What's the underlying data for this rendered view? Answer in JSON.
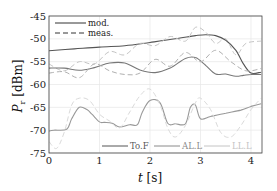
{
  "chart_data": {
    "type": "line",
    "title": "",
    "xlabel": "t [s]",
    "ylabel": "P_r [dBm]",
    "xlim": [
      0,
      4.2
    ],
    "ylim": [
      -75,
      -45
    ],
    "xticks": [
      0,
      1,
      2,
      3,
      4
    ],
    "yticks": [
      -45,
      -50,
      -55,
      -60,
      -65,
      -70,
      -75
    ],
    "grid": true,
    "legends": [
      {
        "position": "upper-left",
        "entries": [
          {
            "label": "mod.",
            "style": "solid"
          },
          {
            "label": "meas.",
            "style": "dashed"
          }
        ]
      },
      {
        "position": "lower-right",
        "entries": [
          {
            "label": "To.F",
            "color": "#555555"
          },
          {
            "label": "AL.L",
            "color": "#8a8a8a"
          },
          {
            "label": "LL.L",
            "color": "#c4c4c4"
          }
        ]
      }
    ],
    "series": [
      {
        "name": "To.F mod.",
        "color": "#555555",
        "style": "solid",
        "x": [
          0,
          0.5,
          1.0,
          1.5,
          2.0,
          2.5,
          2.9,
          3.1,
          3.3,
          3.5,
          3.7,
          3.85,
          4.0,
          4.2
        ],
        "y": [
          -52.6,
          -52.2,
          -51.8,
          -51.5,
          -50.8,
          -50.0,
          -49.3,
          -49.1,
          -49.3,
          -50.3,
          -52.5,
          -55.5,
          -57.5,
          -57.3
        ]
      },
      {
        "name": "To.F meas.",
        "color": "#c4c4c4",
        "style": "dashed",
        "x": [
          0,
          0.3,
          0.6,
          0.9,
          1.2,
          1.5,
          1.8,
          2.1,
          2.4,
          2.7,
          2.9,
          3.1,
          3.3,
          3.5,
          3.7,
          3.9,
          4.2
        ],
        "y": [
          -55.5,
          -57.0,
          -55.0,
          -55.5,
          -52.8,
          -53.5,
          -51.0,
          -51.5,
          -49.5,
          -50.5,
          -47.5,
          -48.5,
          -51.0,
          -50.0,
          -53.5,
          -51.0,
          -50.5
        ]
      },
      {
        "name": "AL.L mod.",
        "color": "#777777",
        "style": "solid",
        "x": [
          0,
          0.3,
          0.6,
          0.9,
          1.2,
          1.5,
          1.8,
          2.1,
          2.4,
          2.7,
          2.9,
          3.1,
          3.3,
          3.5,
          3.7,
          3.85,
          4.0,
          4.2
        ],
        "y": [
          -56.4,
          -56.4,
          -56.9,
          -56.3,
          -55.3,
          -55.3,
          -56.8,
          -57.4,
          -56.4,
          -54.3,
          -54.1,
          -55.8,
          -57.7,
          -57.7,
          -58.2,
          -58.0,
          -57.8,
          -57.8
        ]
      },
      {
        "name": "AL.L meas.",
        "color": "#b0b0b0",
        "style": "dashed",
        "x": [
          0,
          0.3,
          0.6,
          0.9,
          1.2,
          1.5,
          1.8,
          2.1,
          2.4,
          2.7,
          3.0,
          3.3,
          3.6,
          3.9,
          4.2
        ],
        "y": [
          -57.5,
          -57.2,
          -58.5,
          -55.5,
          -57.0,
          -57.8,
          -57.5,
          -54.5,
          -56.0,
          -53.0,
          -55.0,
          -52.5,
          -55.0,
          -57.0,
          -56.5
        ]
      },
      {
        "name": "LL.L mod.",
        "color": "#999999",
        "style": "solid",
        "x": [
          0,
          0.1,
          0.35,
          0.45,
          0.6,
          0.75,
          0.85,
          1.0,
          1.1,
          1.25,
          1.4,
          1.6,
          1.75,
          1.85,
          2.0,
          2.2,
          2.35,
          2.5,
          2.7,
          2.8,
          2.9,
          3.0,
          3.2,
          3.5,
          3.8,
          4.0,
          4.2
        ],
        "y": [
          -70.2,
          -70.0,
          -69.8,
          -67.5,
          -65.0,
          -65.5,
          -66.5,
          -68.2,
          -68.3,
          -68.5,
          -69.3,
          -68.8,
          -68.8,
          -66.0,
          -63.5,
          -64.0,
          -68.5,
          -68.6,
          -68.6,
          -65.0,
          -64.5,
          -67.5,
          -67.0,
          -66.3,
          -65.6,
          -64.8,
          -64.2
        ]
      },
      {
        "name": "LL.L meas.",
        "color": "#dadada",
        "style": "dashed",
        "x": [
          0,
          0.15,
          0.3,
          0.45,
          0.6,
          0.8,
          1.0,
          1.2,
          1.4,
          1.6,
          1.8,
          2.0,
          2.2,
          2.35,
          2.5,
          2.7,
          2.9,
          3.0,
          3.2,
          3.4,
          3.6,
          3.8,
          4.0,
          4.2
        ],
        "y": [
          -72.5,
          -74.0,
          -70.5,
          -64.5,
          -63.0,
          -63.5,
          -66.5,
          -68.0,
          -69.5,
          -66.0,
          -62.5,
          -61.0,
          -64.5,
          -69.5,
          -71.5,
          -69.0,
          -64.0,
          -63.0,
          -65.5,
          -70.5,
          -71.5,
          -69.0,
          -65.5,
          -63.0
        ]
      }
    ]
  }
}
